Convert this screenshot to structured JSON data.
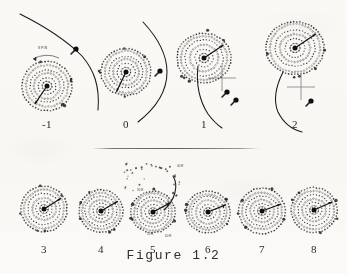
{
  "figure": {
    "caption": "Figure 1.2",
    "background_color": "#f7f6f3",
    "ink_color": "#1a1a1a",
    "crosshair_color": "#8a8a8a"
  },
  "annotations": {
    "spin_label": "SPIN",
    "panel5_labels": [
      "30 R",
      "40 R",
      "50 R",
      "60 R"
    ]
  },
  "rows": [
    {
      "row_name": "top-row",
      "panels": [
        {
          "label": "-1",
          "cx": 47,
          "cy": 86,
          "disk_radius": 26,
          "rings": [
            5,
            9,
            13,
            17,
            21,
            25
          ],
          "has_companion": true,
          "has_crosshair": false,
          "has_spin_label": true,
          "companion_x": 76,
          "companion_y": 49,
          "trajectory": "M 20 14 C 44 26, 66 40, 82 56 C 94 70, 100 86, 98 110",
          "core_arrow_angle": 236,
          "label_x": 47,
          "label_y": 118
        },
        {
          "label": "0",
          "cx": 126,
          "cy": 72,
          "disk_radius": 26,
          "rings": [
            5,
            9,
            13,
            17,
            21,
            25
          ],
          "has_companion": true,
          "has_crosshair": false,
          "has_spin_label": false,
          "companion_x": 160,
          "companion_y": 71,
          "trajectory": "M 143 22 C 158 38, 167 54, 167 72 C 167 92, 156 108, 138 122",
          "core_arrow_angle": 244,
          "label_x": 126,
          "label_y": 118
        },
        {
          "label": "1",
          "cx": 204,
          "cy": 58,
          "disk_radius": 28,
          "rings": [
            5,
            9,
            14,
            19,
            23,
            27
          ],
          "has_companion": true,
          "has_crosshair": true,
          "has_spin_label": false,
          "companion_x": 227,
          "companion_y": 92,
          "crosshair_x": 222,
          "crosshair_y": 78,
          "companion_x2": 236,
          "companion_y2": 100,
          "trajectory": "M 198 66 C 196 84, 199 100, 208 114 C 214 122, 219 126, 222 128",
          "core_arrow_angle": 34,
          "label_x": 204,
          "label_y": 118
        },
        {
          "label": "2",
          "cx": 295,
          "cy": 48,
          "disk_radius": 30,
          "rings": [
            5,
            10,
            15,
            20,
            25,
            29
          ],
          "has_companion": true,
          "has_crosshair": true,
          "has_spin_label": false,
          "companion_x": 311,
          "companion_y": 101,
          "crosshair_x": 301,
          "crosshair_y": 87,
          "trajectory": "M 283 72 C 276 86, 273 100, 278 112 C 284 124, 294 130, 302 132",
          "core_arrow_angle": 34,
          "label_x": 295,
          "label_y": 118
        }
      ]
    },
    {
      "row_name": "bottom-row",
      "panels": [
        {
          "label": "3",
          "cx": 44,
          "cy": 209,
          "disk_radius": 24,
          "rings": [
            4,
            8,
            12,
            16,
            20,
            23
          ],
          "has_companion": false,
          "has_crosshair": false,
          "has_spin_label": false,
          "core_arrow_angle": 32,
          "label_x": 44,
          "label_y": 243
        },
        {
          "label": "4",
          "cx": 101,
          "cy": 211,
          "disk_radius": 23,
          "rings": [
            4,
            8,
            12,
            16,
            19,
            22
          ],
          "has_companion": false,
          "has_crosshair": false,
          "has_spin_label": false,
          "core_arrow_angle": 30,
          "label_x": 101,
          "label_y": 243
        },
        {
          "label": "5",
          "cx": 153,
          "cy": 212,
          "disk_radius": 23,
          "rings": [
            4,
            8,
            12,
            16,
            19,
            22
          ],
          "has_companion": false,
          "has_crosshair": false,
          "has_spin_label": false,
          "has_tidal_tail": true,
          "core_arrow_angle": 28,
          "label_x": 153,
          "label_y": 243
        },
        {
          "label": "6",
          "cx": 208,
          "cy": 212,
          "disk_radius": 23,
          "rings": [
            4,
            8,
            12,
            16,
            19,
            22
          ],
          "has_companion": false,
          "has_crosshair": false,
          "has_spin_label": false,
          "core_arrow_angle": 22,
          "label_x": 208,
          "label_y": 243
        },
        {
          "label": "7",
          "cx": 262,
          "cy": 211,
          "disk_radius": 24,
          "rings": [
            4,
            8,
            12,
            16,
            20,
            23
          ],
          "has_companion": false,
          "has_crosshair": false,
          "has_spin_label": false,
          "core_arrow_angle": 20,
          "label_x": 262,
          "label_y": 243
        },
        {
          "label": "8",
          "cx": 314,
          "cy": 210,
          "disk_radius": 24,
          "rings": [
            4,
            8,
            12,
            16,
            20,
            23
          ],
          "has_companion": false,
          "has_crosshair": false,
          "has_spin_label": false,
          "core_arrow_angle": 24,
          "label_x": 314,
          "label_y": 243
        }
      ]
    }
  ]
}
